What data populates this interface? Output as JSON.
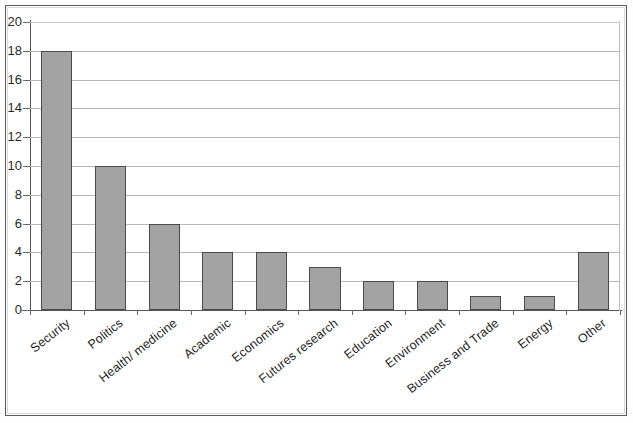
{
  "chart_data": {
    "type": "bar",
    "title": "",
    "xlabel": "",
    "ylabel": "",
    "categories": [
      "Security",
      "Politics",
      "Health/ medicine",
      "Academic",
      "Economics",
      "Futures research",
      "Education",
      "Environment",
      "Business and Trade",
      "Energy",
      "Other"
    ],
    "values": [
      18,
      10,
      6,
      4,
      4,
      3,
      2,
      2,
      1,
      1,
      4
    ],
    "ylim": [
      0,
      20
    ],
    "ytick_step": 2,
    "yticks": [
      0,
      2,
      4,
      6,
      8,
      10,
      12,
      14,
      16,
      18,
      20
    ],
    "ytick_labels": [
      "0",
      "2",
      "4",
      "6",
      "8",
      "10",
      "12",
      "14",
      "16",
      "18",
      "20"
    ],
    "grid": true,
    "legend": false,
    "bar_color": "#a3a3a3",
    "bar_border_color": "#4a4a4a",
    "gridline_color": "#b9b9b9",
    "axis_color": "#555555",
    "frame_color": "#5a5a5a",
    "background_color": "#ffffff",
    "label_rotation_deg": -38
  }
}
